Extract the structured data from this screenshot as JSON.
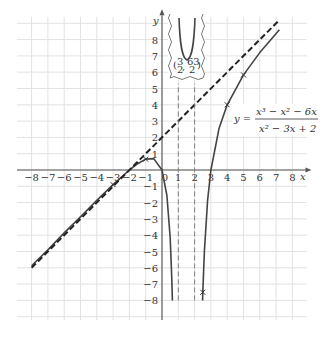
{
  "chart_data": {
    "type": "line",
    "title": "",
    "equation": {
      "lhs": "y =",
      "numerator": "x³ − x² − 6x",
      "denominator": "x² − 3x + 2"
    },
    "xlabel": "x",
    "ylabel": "y",
    "xlim": [
      -8,
      8
    ],
    "ylim": [
      -8,
      8
    ],
    "grid": true,
    "x_ticks": [
      "-8",
      "-7",
      "-6",
      "-5",
      "-4",
      "-3",
      "-2",
      "-1",
      "0",
      "1",
      "2",
      "3",
      "4",
      "5",
      "6",
      "7",
      "8"
    ],
    "y_ticks": [
      "8",
      "7",
      "6",
      "5",
      "4",
      "3",
      "2",
      "1",
      "-1",
      "-2",
      "-3",
      "-4",
      "-5",
      "-6",
      "-7",
      "-8"
    ],
    "series": [
      {
        "name": "left branch",
        "style": "solid",
        "x": [
          -8,
          -7,
          -6,
          -5,
          -4,
          -3,
          -2,
          -1.5,
          -1,
          -0.5,
          0,
          0.3,
          0.5,
          0.6,
          0.64
        ],
        "y": [
          -5.87,
          -4.9,
          -3.857,
          -2.88,
          -1.867,
          -0.9,
          0,
          0.386,
          0.667,
          0.7,
          0,
          -1.566,
          -4.167,
          -6.686,
          -8
        ]
      },
      {
        "name": "right branch",
        "style": "solid",
        "x": [
          2.49,
          2.5,
          2.6,
          2.8,
          3,
          3.5,
          4,
          5,
          6,
          7.2
        ],
        "y": [
          -8,
          -7.5,
          -4.98,
          -1.867,
          0,
          2.567,
          4,
          5.833,
          7.2,
          8.6
        ]
      },
      {
        "name": "slant asymptote y = x + 2",
        "style": "dashed",
        "x": [
          -8,
          7.1
        ],
        "y": [
          -6,
          9.1
        ]
      },
      {
        "name": "vertical asymptote x = 1",
        "style": "dashed",
        "x": [
          1,
          1
        ],
        "y": [
          -8,
          5.3
        ]
      },
      {
        "name": "vertical asymptote x = 2",
        "style": "dashed",
        "x": [
          2,
          2
        ],
        "y": [
          -8,
          5.3
        ]
      }
    ],
    "marked_points": [
      {
        "x": -3,
        "y": -0.9
      },
      {
        "x": -1,
        "y": 0.667
      },
      {
        "x": 2.5,
        "y": -7.5
      },
      {
        "x": 4,
        "y": 4
      },
      {
        "x": 5,
        "y": 5.833
      }
    ],
    "inset": {
      "description": "broken-axis inset showing middle branch local minimum",
      "min_point_label_x_num": "3",
      "min_point_label_x_den": "2",
      "min_point_label_y_num": "63",
      "min_point_label_y_den": "2",
      "min_point": [
        1.5,
        31.5
      ]
    }
  }
}
